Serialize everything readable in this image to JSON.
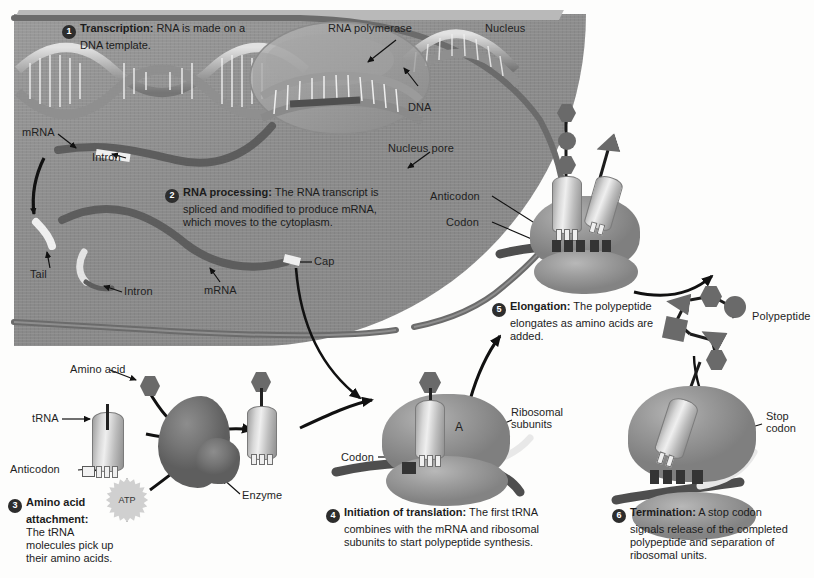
{
  "diagram": {
    "background_color": "#ffffff",
    "nucleus_color": "#8e8e8e",
    "membrane_color": "#6b6b6b",
    "accent_dark": "#2d2d2d"
  },
  "steps": [
    {
      "number": "1",
      "heading": "Transcription:",
      "body": " RNA is made on a DNA template.",
      "line1": "Transcription: RNA is made on a",
      "line2": "DNA template."
    },
    {
      "number": "2",
      "heading": "RNA processing:",
      "body": " The RNA transcript is spliced and modified to produce mRNA, which moves to the cytoplasm.",
      "line1": "RNA processing: The RNA transcript is",
      "line2": "spliced and modified to produce mRNA,",
      "line3": "which moves to the cytoplasm."
    },
    {
      "number": "3",
      "heading": "Amino acid attachment:",
      "body": " The tRNA molecules pick up their amino acids.",
      "line1": "Amino acid",
      "line2": "attachment:",
      "line3": "The tRNA",
      "line4": "molecules pick up",
      "line5": "their amino acids."
    },
    {
      "number": "4",
      "heading": "Initiation of translation:",
      "body": " The first tRNA combines with the mRNA and ribosomal subunits to start polypeptide synthesis.",
      "line1": "Initiation of translation: The first tRNA",
      "line2": "combines with the mRNA and ribosomal",
      "line3": "subunits to start polypeptide synthesis."
    },
    {
      "number": "5",
      "heading": "Elongation:",
      "body": " The polypeptide elongates as amino acids are added.",
      "line1": "Elongation: The polypeptide",
      "line2": "elongates as amino acids are",
      "line3": "added."
    },
    {
      "number": "6",
      "heading": "Termination:",
      "body": " A stop codon signals release of the completed polypeptide and separation of ribosomal units.",
      "line1": "Termination: A stop codon",
      "line2": "signals release of the completed",
      "line3": "polypeptide and separation of",
      "line4": "ribosomal units."
    }
  ],
  "labels": {
    "rna_polymerase": "RNA polymerase",
    "nucleus": "Nucleus",
    "dna": "DNA",
    "nucleus_pore": "Nucleus pore",
    "mrna_top": "mRNA",
    "intron_top": "Intron",
    "tail": "Tail",
    "intron_bottom": "Intron",
    "mrna_bottom": "mRNA",
    "cap": "Cap",
    "anticodon_elong": "Anticodon",
    "codon_elong": "Codon",
    "polypeptide": "Polypeptide",
    "stop_codon_line1": "Stop",
    "stop_codon_line2": "codon",
    "amino_acid": "Amino acid",
    "trna": "tRNA",
    "anticodon_trna": "Anticodon",
    "atp": "ATP",
    "enzyme": "Enzyme",
    "codon_init": "Codon",
    "ribosomal_line1": "Ribosomal",
    "ribosomal_line2": "subunits",
    "a_site": "A"
  }
}
